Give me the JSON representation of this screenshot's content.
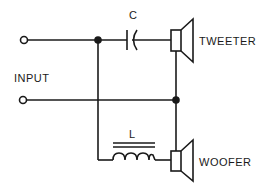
{
  "diagram": {
    "labels": {
      "input": "INPUT",
      "capacitor": "C",
      "inductor": "L",
      "tweeter": "TWEETER",
      "woofer": "WOOFER"
    },
    "components": [
      {
        "id": "C",
        "type": "capacitor",
        "connects": [
          "input-top-node",
          "tweeter"
        ]
      },
      {
        "id": "L",
        "type": "inductor",
        "connects": [
          "input-top-node",
          "woofer"
        ]
      },
      {
        "id": "tweeter",
        "type": "speaker"
      },
      {
        "id": "woofer",
        "type": "speaker"
      }
    ],
    "terminals": 2,
    "junctions": 2,
    "colors": {
      "line": "#1a1a1a",
      "background": "#ffffff"
    }
  }
}
